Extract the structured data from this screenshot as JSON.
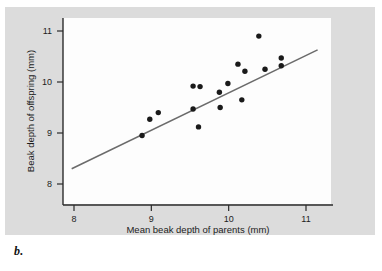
{
  "caption": "b.",
  "axes": {
    "x_title": "Mean beak depth of parents (mm)",
    "y_title": "Beak depth of offspring (mm)",
    "x_ticks": [
      "8",
      "9",
      "10",
      "11"
    ],
    "y_ticks": [
      "8",
      "9",
      "10",
      "11"
    ]
  },
  "colors": {
    "panel_background": "#dcdcdc",
    "plot_background": "#fdfdfd",
    "axis": "#2b2b2b",
    "point": "#1a1a1a",
    "fit_line": "#6b6b6b",
    "text": "#1c1c1c"
  },
  "chart_data": {
    "type": "scatter",
    "title": "",
    "xlabel": "Mean beak depth of parents (mm)",
    "ylabel": "Beak depth of offspring (mm)",
    "xlim": [
      7.85,
      11.25
    ],
    "ylim": [
      7.6,
      11.2
    ],
    "xticks": [
      8,
      9,
      10,
      11
    ],
    "yticks": [
      8,
      9,
      10,
      11
    ],
    "grid": false,
    "legend": null,
    "points": [
      {
        "x": 8.88,
        "y": 8.95
      },
      {
        "x": 8.98,
        "y": 9.27
      },
      {
        "x": 9.09,
        "y": 9.4
      },
      {
        "x": 9.54,
        "y": 9.92
      },
      {
        "x": 9.54,
        "y": 9.47
      },
      {
        "x": 9.63,
        "y": 9.91
      },
      {
        "x": 9.61,
        "y": 9.12
      },
      {
        "x": 9.88,
        "y": 9.8
      },
      {
        "x": 9.89,
        "y": 9.5
      },
      {
        "x": 9.99,
        "y": 9.97
      },
      {
        "x": 10.12,
        "y": 10.35
      },
      {
        "x": 10.17,
        "y": 9.65
      },
      {
        "x": 10.21,
        "y": 10.21
      },
      {
        "x": 10.39,
        "y": 10.9
      },
      {
        "x": 10.47,
        "y": 10.25
      },
      {
        "x": 10.68,
        "y": 10.47
      },
      {
        "x": 10.68,
        "y": 10.32
      }
    ],
    "fit_line": {
      "type": "linear-regression",
      "x_start": 7.97,
      "y_start": 8.3,
      "x_end": 11.15,
      "y_end": 10.63
    }
  }
}
